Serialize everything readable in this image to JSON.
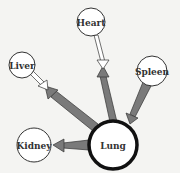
{
  "diagram": {
    "nodes": [
      {
        "id": "heart",
        "label": "Heart",
        "cx": 91,
        "cy": 22,
        "r": 14,
        "stroke_width": 1
      },
      {
        "id": "liver",
        "label": "Liver",
        "cx": 22,
        "cy": 65,
        "r": 13,
        "stroke_width": 1
      },
      {
        "id": "spleen",
        "label": "Spleen",
        "cx": 152,
        "cy": 71,
        "r": 15,
        "stroke_width": 1
      },
      {
        "id": "kidney",
        "label": "Kidney",
        "cx": 34,
        "cy": 145,
        "r": 17,
        "stroke_width": 1
      },
      {
        "id": "lung",
        "label": "Lung",
        "cx": 113,
        "cy": 145,
        "r": 24,
        "stroke_width": 3.5
      }
    ],
    "edges": [
      {
        "from": "heart",
        "to": "lung",
        "style": "white",
        "description": "white arrow from Heart pointing down toward Lung"
      },
      {
        "from": "lung",
        "to": "heart",
        "style": "gray",
        "description": "gray arrow from Lung pointing up toward Heart"
      },
      {
        "from": "liver",
        "to": "lung",
        "style": "white",
        "description": "white arrow from Liver pointing toward Lung"
      },
      {
        "from": "lung",
        "to": "liver",
        "style": "gray",
        "description": "gray arrow from Lung pointing toward Liver"
      },
      {
        "from": "spleen",
        "to": "lung",
        "style": "gray",
        "description": "gray arrow from Spleen to Lung"
      },
      {
        "from": "lung",
        "to": "kidney",
        "style": "gray",
        "description": "gray arrow from Lung to Kidney"
      }
    ],
    "colors": {
      "background": "#f4f4f2",
      "gray_arrow": "#7a7a7a",
      "white_arrow": "#ffffff",
      "stroke": "#222222"
    }
  }
}
